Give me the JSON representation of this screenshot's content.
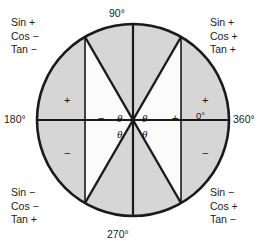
{
  "diagram": {
    "type": "unit-circle",
    "geometry": {
      "center_x": 133,
      "center_y": 120,
      "radius": 96,
      "fill_shaded": "#d6d6d6",
      "fill_clear": "#fbfbfb",
      "stroke": "#1a1a1a"
    },
    "angles": {
      "top": "90°",
      "bottom": "270°",
      "left": "180°",
      "right_outer": "360°",
      "right_inner": "0°"
    },
    "quadrants": {
      "top_left": {
        "sin": "Sin +",
        "cos": "Cos −",
        "tan": "Tan −"
      },
      "top_right": {
        "sin": "Sin +",
        "cos": "Cos +",
        "tan": "Tan +"
      },
      "bottom_left": {
        "sin": "Sin −",
        "cos": "Cos −",
        "tan": "Tan +"
      },
      "bottom_right": {
        "sin": "Sin −",
        "cos": "Cos +",
        "tan": "Tan −"
      }
    },
    "theta_labels": {
      "upper_right": "θ",
      "upper_left": "θ",
      "lower_right": "θ",
      "lower_left": "θ"
    },
    "signs": {
      "upper_left": "+",
      "upper_right": "+",
      "lower_left": "−",
      "lower_right": "−",
      "axis_left": "−",
      "axis_right": "+"
    }
  }
}
